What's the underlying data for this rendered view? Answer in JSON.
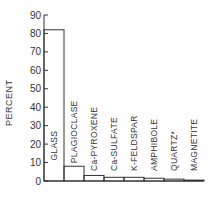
{
  "chart_data": {
    "type": "bar",
    "title": "",
    "xlabel": "",
    "ylabel": "PERCENT",
    "ylim": [
      0,
      90
    ],
    "yticks": [
      0,
      10,
      20,
      30,
      40,
      50,
      60,
      70,
      80,
      90
    ],
    "grid": false,
    "legend": null,
    "categories": [
      "GLASS",
      "PLAGIOCLASE",
      "Ca-PYROXENE",
      "Ca-SULFATE",
      "K-FELDSPAR",
      "AMPHIBOLE",
      "QUARTZ*",
      "MAGNETITE"
    ],
    "values": [
      82,
      8,
      3,
      2,
      2,
      1.5,
      1,
      0.5
    ]
  },
  "colors": {
    "line": "#333333",
    "background": "#ffffff"
  }
}
